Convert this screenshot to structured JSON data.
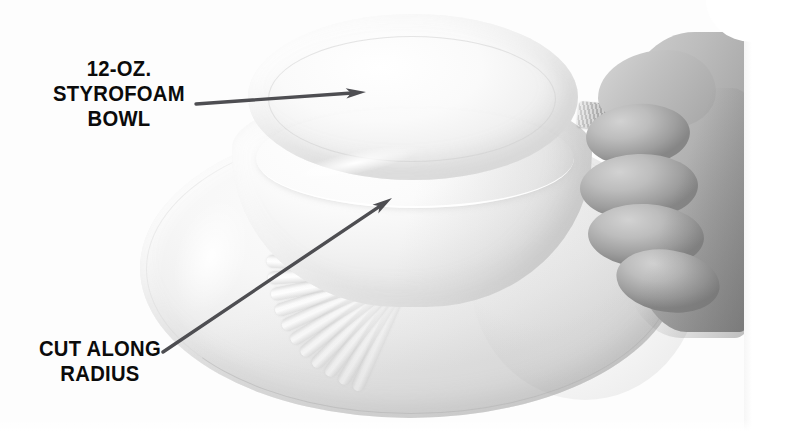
{
  "figure": {
    "type": "instructional-photo",
    "background_color": "#ffffff"
  },
  "annotations": {
    "callouts": [
      {
        "id": "styrofoam-bowl",
        "line1": "12-OZ.",
        "line2": "STYROFOAM",
        "line3": "BOWL",
        "text": "12-OZ.\nSTYROFOAM\nBOWL",
        "text_color": "#0b0b0b",
        "arrow": {
          "color": "#4e4e52",
          "from_x": 196,
          "from_y": 104,
          "to_x": 366,
          "to_y": 92
        }
      },
      {
        "id": "cut-along-radius",
        "line1": "CUT ALONG",
        "line2": "RADIUS",
        "text": "CUT ALONG\nRADIUS",
        "text_color": "#0b0b0b",
        "arrow": {
          "color": "#4e4e52",
          "from_x": 163,
          "from_y": 352,
          "to_x": 392,
          "to_y": 198
        }
      }
    ]
  },
  "photo": {
    "bowl": {
      "material_color": "#f4f4f4",
      "flute_count": 26,
      "description": "upside-down fluted foam bowl"
    },
    "hand": {
      "skin_tone": "#b4b4b4",
      "description": "hand gripping the bowl rim and pinching a torn foam tab"
    },
    "torn_tab": {
      "color": "#a8a8a8",
      "description": "torn styrofoam edge at start of the radial cut"
    }
  }
}
